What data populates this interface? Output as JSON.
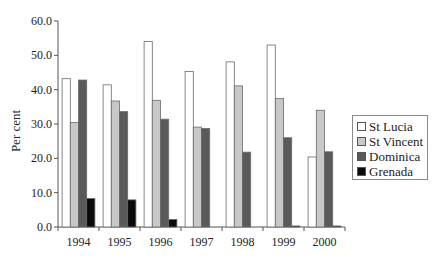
{
  "chart_data": {
    "type": "bar",
    "title": "",
    "xlabel": "",
    "ylabel": "Per cent",
    "ylim": [
      0,
      60
    ],
    "yticks": [
      0.0,
      10.0,
      20.0,
      30.0,
      40.0,
      50.0,
      60.0
    ],
    "ytick_labels": [
      "0.0",
      "10.0",
      "20.0",
      "30.0",
      "40.0",
      "50.0",
      "60.0"
    ],
    "grid": false,
    "legend_position": "right",
    "categories": [
      "1994",
      "1995",
      "1996",
      "1997",
      "1998",
      "1999",
      "2000"
    ],
    "series": [
      {
        "name": "St Lucia",
        "color": "#ffffff",
        "values": [
          43.2,
          41.4,
          54.0,
          45.3,
          48.1,
          53.0,
          20.4
        ]
      },
      {
        "name": "St Vincent",
        "color": "#c8c8c8",
        "values": [
          30.4,
          36.7,
          36.9,
          29.1,
          41.1,
          37.4,
          34.0
        ]
      },
      {
        "name": "Dominica",
        "color": "#5a5a5a",
        "values": [
          42.8,
          33.6,
          31.4,
          28.7,
          21.8,
          26.0,
          21.9
        ]
      },
      {
        "name": "Grenada",
        "color": "#0a0a0a",
        "values": [
          8.3,
          7.9,
          2.2,
          0.0,
          0.0,
          0.3,
          0.3
        ]
      }
    ]
  },
  "legend": {
    "items": [
      {
        "label": "St Lucia",
        "color": "#ffffff"
      },
      {
        "label": "St Vincent",
        "color": "#c8c8c8"
      },
      {
        "label": "Dominica",
        "color": "#5a5a5a"
      },
      {
        "label": "Grenada",
        "color": "#0a0a0a"
      }
    ]
  }
}
